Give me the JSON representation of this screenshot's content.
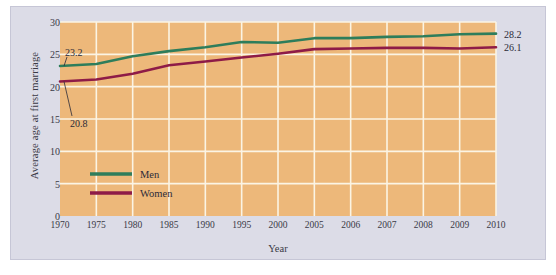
{
  "figure": {
    "background_color": "#dcdce7",
    "plot_background_color": "#edb87a",
    "grid_color": "#fbf4e4",
    "page_background_color": "#ffffff"
  },
  "axes": {
    "ylabel": "Average age at first marriage",
    "xlabel": "Year",
    "yticks": [
      "0",
      "5",
      "10",
      "15",
      "20",
      "25",
      "30"
    ],
    "ylim": [
      0,
      30
    ],
    "grid": true
  },
  "legend": {
    "position": "inside-lower-left",
    "entries": [
      {
        "label": "Men",
        "color": "#2e7d5b"
      },
      {
        "label": "Women",
        "color": "#8e1b47"
      }
    ]
  },
  "annotations": [
    {
      "text": "23.2",
      "series": "Men",
      "category": "1970"
    },
    {
      "text": "20.8",
      "series": "Women",
      "category": "1970"
    },
    {
      "text": "28.2",
      "series": "Men",
      "category": "2010"
    },
    {
      "text": "26.1",
      "series": "Women",
      "category": "2010"
    }
  ],
  "chart_data": {
    "type": "line",
    "title": "",
    "subtitle": "",
    "xlabel": "Year",
    "ylabel": "Average age at first marriage",
    "ylim": [
      0,
      30
    ],
    "grid": true,
    "categories": [
      "1970",
      "1975",
      "1980",
      "1985",
      "1990",
      "1995",
      "2000",
      "2005",
      "2006",
      "2007",
      "2008",
      "2009",
      "2010"
    ],
    "series": [
      {
        "name": "Men",
        "color": "#2e7d5b",
        "values": [
          23.2,
          23.5,
          24.7,
          25.5,
          26.1,
          26.9,
          26.8,
          27.5,
          27.5,
          27.7,
          27.8,
          28.1,
          28.2
        ]
      },
      {
        "name": "Women",
        "color": "#8e1b47",
        "values": [
          20.8,
          21.1,
          22.0,
          23.3,
          23.9,
          24.5,
          25.1,
          25.8,
          25.9,
          26.0,
          26.0,
          25.9,
          26.1
        ]
      }
    ]
  }
}
